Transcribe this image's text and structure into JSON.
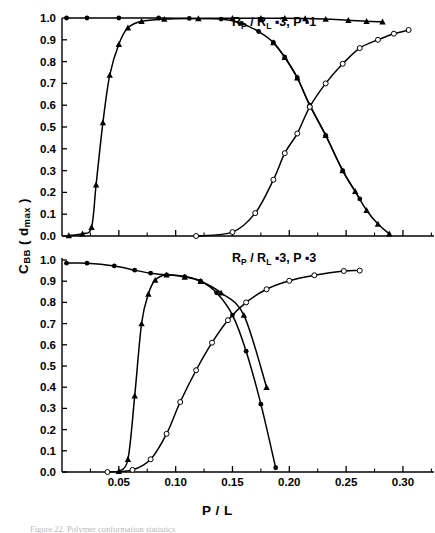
{
  "figure": {
    "y_axis_title": "C",
    "y_axis_title_sub": "BB",
    "y_axis_title_paren_open": " ( d",
    "y_axis_title_sub2": "max",
    "y_axis_title_paren_close": " )",
    "x_axis_title": "P / L",
    "caption": "Figure 22.  Polymer conformation statistics"
  },
  "chart_data": [
    {
      "type": "line",
      "panel": "top",
      "title": "Rₚ/Rₗ =3, P=1",
      "annotation": "R_P / R_L =3,  P = 1",
      "xlabel": "P / L",
      "ylabel": "C_BB ( d_max )",
      "xlim": [
        0.0,
        0.315
      ],
      "ylim": [
        0.0,
        1.0
      ],
      "xticks": [
        0.05,
        0.1,
        0.15,
        0.2,
        0.25,
        0.3
      ],
      "xticklabels": [
        "0.05",
        "0.10",
        "0.15",
        "0.20",
        "0.25",
        "0.30"
      ],
      "yticks": [
        0.0,
        0.1,
        0.2,
        0.3,
        0.4,
        0.5,
        0.6,
        0.7,
        0.8,
        0.9,
        1.0
      ],
      "yticklabels": [
        "0.0",
        "0.1",
        "0.2",
        "0.3",
        "0.4",
        "0.5",
        "0.6",
        "0.7",
        "0.8",
        "0.9",
        "1.0"
      ],
      "grid": false,
      "legend": "none",
      "series": [
        {
          "name": "plateau-decay",
          "marker": "filled-circle",
          "x": [
            0.004,
            0.022,
            0.05,
            0.085,
            0.112,
            0.14,
            0.158,
            0.173,
            0.186,
            0.196,
            0.207,
            0.218,
            0.232,
            0.247,
            0.262
          ],
          "y": [
            1.0,
            1.0,
            1.0,
            1.0,
            0.998,
            0.995,
            0.975,
            0.938,
            0.888,
            0.82,
            0.726,
            0.6,
            0.462,
            0.3,
            0.17
          ]
        },
        {
          "name": "steep-rise",
          "marker": "filled-triangle",
          "x": [
            0.006,
            0.018,
            0.026,
            0.03,
            0.036,
            0.042,
            0.05,
            0.058,
            0.07,
            0.09,
            0.12,
            0.15,
            0.175,
            0.196,
            0.214,
            0.232,
            0.252,
            0.268,
            0.282
          ],
          "y": [
            0.002,
            0.01,
            0.04,
            0.235,
            0.52,
            0.738,
            0.88,
            0.955,
            0.985,
            0.995,
            0.998,
            0.999,
            0.999,
            0.999,
            0.998,
            0.995,
            0.99,
            0.985,
            0.983
          ]
        },
        {
          "name": "descend-to-zero",
          "marker": "filled-triangle",
          "x": [
            0.186,
            0.196,
            0.207,
            0.218,
            0.232,
            0.247,
            0.258,
            0.268,
            0.278,
            0.288
          ],
          "y": [
            0.888,
            0.82,
            0.726,
            0.6,
            0.462,
            0.3,
            0.205,
            0.118,
            0.055,
            0.01
          ]
        },
        {
          "name": "open-rise",
          "marker": "open-circle",
          "x": [
            0.118,
            0.15,
            0.17,
            0.186,
            0.196,
            0.207,
            0.218,
            0.232,
            0.247,
            0.262,
            0.278,
            0.292,
            0.305
          ],
          "y": [
            0.0,
            0.018,
            0.105,
            0.258,
            0.38,
            0.47,
            0.592,
            0.7,
            0.79,
            0.862,
            0.9,
            0.928,
            0.945
          ]
        }
      ]
    },
    {
      "type": "line",
      "panel": "bottom",
      "title": "Rₚ/Rₗ =3, P=3",
      "annotation": "R_P / R_L =3,  P = 3",
      "xlabel": "P / L",
      "ylabel": "C_BB ( d_max )",
      "xlim": [
        0.0,
        0.315
      ],
      "ylim": [
        0.0,
        1.0
      ],
      "xticks": [
        0.05,
        0.1,
        0.15,
        0.2,
        0.25,
        0.3
      ],
      "xticklabels": [
        "0.05",
        "0.10",
        "0.15",
        "0.20",
        "0.25",
        "0.30"
      ],
      "yticks": [
        0.0,
        0.1,
        0.2,
        0.3,
        0.4,
        0.5,
        0.6,
        0.7,
        0.8,
        0.9,
        1.0
      ],
      "yticklabels": [
        "0.0",
        "0.1",
        "0.2",
        "0.3",
        "0.4",
        "0.5",
        "0.6",
        "0.7",
        "0.8",
        "0.9",
        "1.0"
      ],
      "grid": false,
      "legend": "none",
      "series": [
        {
          "name": "plateau-decay",
          "marker": "filled-circle",
          "x": [
            0.004,
            0.022,
            0.046,
            0.064,
            0.078,
            0.092,
            0.108,
            0.122,
            0.136,
            0.15,
            0.162,
            0.175,
            0.188
          ],
          "y": [
            0.985,
            0.985,
            0.972,
            0.952,
            0.938,
            0.93,
            0.922,
            0.9,
            0.845,
            0.74,
            0.57,
            0.32,
            0.02
          ]
        },
        {
          "name": "steep-rise",
          "marker": "filled-triangle",
          "x": [
            0.05,
            0.058,
            0.064,
            0.07,
            0.076,
            0.082,
            0.092,
            0.108,
            0.122,
            0.14,
            0.16,
            0.18
          ],
          "y": [
            0.003,
            0.06,
            0.36,
            0.7,
            0.84,
            0.905,
            0.93,
            0.92,
            0.9,
            0.845,
            0.74,
            0.4
          ]
        },
        {
          "name": "open-rise",
          "marker": "open-circle",
          "x": [
            0.04,
            0.062,
            0.078,
            0.092,
            0.104,
            0.118,
            0.132,
            0.146,
            0.162,
            0.18,
            0.2,
            0.222,
            0.248,
            0.262
          ],
          "y": [
            0.0,
            0.01,
            0.06,
            0.18,
            0.33,
            0.48,
            0.61,
            0.716,
            0.8,
            0.862,
            0.902,
            0.928,
            0.948,
            0.95
          ]
        }
      ]
    }
  ]
}
